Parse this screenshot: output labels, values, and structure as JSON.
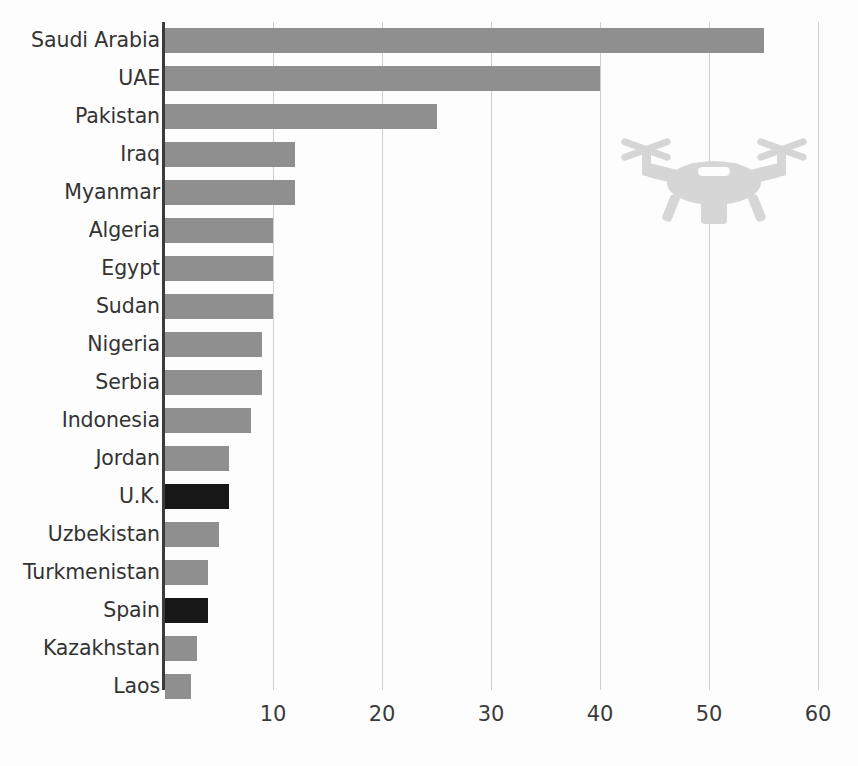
{
  "chart_data": {
    "type": "bar",
    "orientation": "horizontal",
    "title": "",
    "subtitle": "",
    "xlabel": "",
    "ylabel": "",
    "xlim": [
      0,
      60
    ],
    "xticks": [
      10,
      20,
      30,
      40,
      50,
      60
    ],
    "xtick_labels": [
      "10",
      "20",
      "30",
      "40",
      "50",
      "60"
    ],
    "grid": "vertical gridlines at each x tick",
    "legend": "none",
    "categories": [
      "Saudi Arabia",
      "UAE",
      "Pakistan",
      "Iraq",
      "Myanmar",
      "Algeria",
      "Egypt",
      "Sudan",
      "Nigeria",
      "Serbia",
      "Indonesia",
      "Jordan",
      "U.K.",
      "Uzbekistan",
      "Turkmenistan",
      "Spain",
      "Kazakhstan",
      "Laos"
    ],
    "values": [
      55,
      40,
      25,
      12,
      12,
      10,
      10,
      10,
      9,
      9,
      8,
      6,
      6,
      5,
      4,
      4,
      3,
      2.5
    ],
    "bar_colors": [
      "#8f8f8f",
      "#8f8f8f",
      "#8f8f8f",
      "#8f8f8f",
      "#8f8f8f",
      "#8f8f8f",
      "#8f8f8f",
      "#8f8f8f",
      "#8f8f8f",
      "#8f8f8f",
      "#8f8f8f",
      "#8f8f8f",
      "#171717",
      "#8f8f8f",
      "#8f8f8f",
      "#171717",
      "#8f8f8f",
      "#8f8f8f"
    ],
    "highlighted": [
      "U.K.",
      "Spain"
    ],
    "annotations": [
      "drone-silhouette-icon"
    ],
    "colors": {
      "bar_default": "#8f8f8f",
      "bar_highlight": "#171717",
      "axis": "#3b3b3b",
      "gridline": "#cfcfcf",
      "text": "#333333",
      "icon": "#d6d6d6",
      "background": "#fdfdfd"
    }
  },
  "bars": [
    {
      "label": "Saudi Arabia",
      "value": 55,
      "highlight": false
    },
    {
      "label": "UAE",
      "value": 40,
      "highlight": false
    },
    {
      "label": "Pakistan",
      "value": 25,
      "highlight": false
    },
    {
      "label": "Iraq",
      "value": 12,
      "highlight": false
    },
    {
      "label": "Myanmar",
      "value": 12,
      "highlight": false
    },
    {
      "label": "Algeria",
      "value": 10,
      "highlight": false
    },
    {
      "label": "Egypt",
      "value": 10,
      "highlight": false
    },
    {
      "label": "Sudan",
      "value": 10,
      "highlight": false
    },
    {
      "label": "Nigeria",
      "value": 9,
      "highlight": false
    },
    {
      "label": "Serbia",
      "value": 9,
      "highlight": false
    },
    {
      "label": "Indonesia",
      "value": 8,
      "highlight": false
    },
    {
      "label": "Jordan",
      "value": 6,
      "highlight": false
    },
    {
      "label": "U.K.",
      "value": 6,
      "highlight": true
    },
    {
      "label": "Uzbekistan",
      "value": 5,
      "highlight": false
    },
    {
      "label": "Turkmenistan",
      "value": 4,
      "highlight": false
    },
    {
      "label": "Spain",
      "value": 4,
      "highlight": true
    },
    {
      "label": "Kazakhstan",
      "value": 3,
      "highlight": false
    },
    {
      "label": "Laos",
      "value": 2.5,
      "highlight": false
    }
  ],
  "xaxis": {
    "ticks": [
      {
        "value": 10,
        "label": "10"
      },
      {
        "value": 20,
        "label": "20"
      },
      {
        "value": 30,
        "label": "30"
      },
      {
        "value": 40,
        "label": "40"
      },
      {
        "value": 50,
        "label": "50"
      },
      {
        "value": 60,
        "label": "60"
      }
    ]
  },
  "icon": {
    "name": "drone-icon",
    "color": "#d6d6d6"
  }
}
